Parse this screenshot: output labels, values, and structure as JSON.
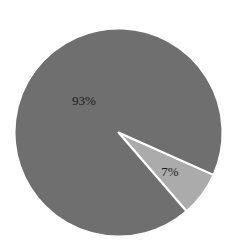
{
  "chart_data": {
    "type": "pie",
    "title": "",
    "categories": [
      "Slice A",
      "Slice B"
    ],
    "values": [
      93,
      7
    ],
    "labels": [
      "93%",
      "7%"
    ],
    "colors": [
      "#6f6f6f",
      "#ababab"
    ],
    "separator_color": "#ffffff",
    "start_angle_deg": 24,
    "direction": "clockwise",
    "legend": "none"
  },
  "labels": {
    "large": "93%",
    "small": "7%"
  }
}
